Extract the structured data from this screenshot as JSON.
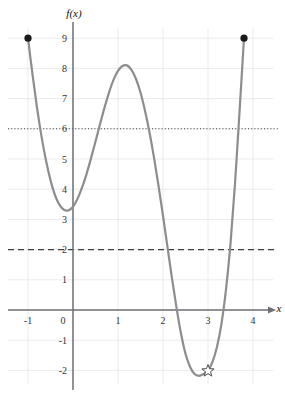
{
  "chart_data": {
    "type": "line",
    "title": "",
    "xlabel": "x",
    "ylabel": "f(x)",
    "xlim": [
      -1.45,
      4.45
    ],
    "ylim": [
      -2.45,
      9.35
    ],
    "grid": true,
    "legend": "none",
    "x_ticks": [
      -1,
      0,
      1,
      2,
      3,
      4
    ],
    "x_tick_labels": [
      "-1",
      "0",
      "1",
      "2",
      "3",
      "4"
    ],
    "y_ticks": [
      -2,
      -1,
      0,
      1,
      2,
      3,
      4,
      5,
      6,
      7,
      8,
      9
    ],
    "y_tick_labels": [
      "-2",
      "-1",
      "0",
      "1",
      "2",
      "3",
      "4",
      "5",
      "6",
      "7",
      "8",
      "9"
    ],
    "series": [
      {
        "name": "f(x)",
        "style": "solid",
        "color": "#8d8d91",
        "domain": [
          -1.0,
          3.8
        ],
        "points": [
          {
            "x": -1.0,
            "y": 9.0
          },
          {
            "x": -0.9,
            "y": 7.8
          },
          {
            "x": -0.8,
            "y": 6.7
          },
          {
            "x": -0.7,
            "y": 5.75
          },
          {
            "x": -0.6,
            "y": 4.95
          },
          {
            "x": -0.5,
            "y": 4.3
          },
          {
            "x": -0.4,
            "y": 3.8
          },
          {
            "x": -0.3,
            "y": 3.48
          },
          {
            "x": -0.2,
            "y": 3.32
          },
          {
            "x": -0.1,
            "y": 3.3
          },
          {
            "x": 0.0,
            "y": 3.42
          },
          {
            "x": 0.1,
            "y": 3.68
          },
          {
            "x": 0.2,
            "y": 4.05
          },
          {
            "x": 0.3,
            "y": 4.5
          },
          {
            "x": 0.4,
            "y": 5.02
          },
          {
            "x": 0.5,
            "y": 5.58
          },
          {
            "x": 0.6,
            "y": 6.15
          },
          {
            "x": 0.7,
            "y": 6.7
          },
          {
            "x": 0.8,
            "y": 7.2
          },
          {
            "x": 0.9,
            "y": 7.62
          },
          {
            "x": 1.0,
            "y": 7.92
          },
          {
            "x": 1.1,
            "y": 8.08
          },
          {
            "x": 1.2,
            "y": 8.1
          },
          {
            "x": 1.3,
            "y": 7.95
          },
          {
            "x": 1.4,
            "y": 7.65
          },
          {
            "x": 1.5,
            "y": 7.2
          },
          {
            "x": 1.6,
            "y": 6.6
          },
          {
            "x": 1.7,
            "y": 5.88
          },
          {
            "x": 1.8,
            "y": 5.05
          },
          {
            "x": 1.9,
            "y": 4.12
          },
          {
            "x": 2.0,
            "y": 3.12
          },
          {
            "x": 2.1,
            "y": 2.08
          },
          {
            "x": 2.2,
            "y": 1.05
          },
          {
            "x": 2.3,
            "y": 0.08
          },
          {
            "x": 2.4,
            "y": -0.78
          },
          {
            "x": 2.5,
            "y": -1.45
          },
          {
            "x": 2.6,
            "y": -1.88
          },
          {
            "x": 2.7,
            "y": -2.12
          },
          {
            "x": 2.8,
            "y": -2.18
          },
          {
            "x": 2.9,
            "y": -2.12
          },
          {
            "x": 3.0,
            "y": -2.0
          },
          {
            "x": 3.1,
            "y": -1.72
          },
          {
            "x": 3.2,
            "y": -1.22
          },
          {
            "x": 3.3,
            "y": -0.45
          },
          {
            "x": 3.4,
            "y": 0.68
          },
          {
            "x": 3.5,
            "y": 2.2
          },
          {
            "x": 3.6,
            "y": 4.18
          },
          {
            "x": 3.7,
            "y": 6.55
          },
          {
            "x": 3.8,
            "y": 9.0
          }
        ]
      }
    ],
    "reference_lines": [
      {
        "name": "dotted-line-y6",
        "axis": "horizontal",
        "value": 6,
        "style": "dotted",
        "label": "6"
      },
      {
        "name": "dashed-line-y2",
        "axis": "horizontal",
        "value": 2,
        "style": "dashed",
        "label": "2"
      }
    ],
    "markers": [
      {
        "name": "left-endpoint",
        "shape": "filled-circle",
        "x": -1.0,
        "y": 9.0
      },
      {
        "name": "right-endpoint",
        "shape": "filled-circle",
        "x": 3.8,
        "y": 9.0
      },
      {
        "name": "global-minimum-star",
        "shape": "open-star",
        "x": 3.0,
        "y": -2.0
      }
    ],
    "annotations": {
      "local_minimum_left": {
        "x": -0.1,
        "y": 3.3
      },
      "local_maximum": {
        "x": 1.15,
        "y": 8.1
      },
      "global_minimum": {
        "x": 2.85,
        "y": -2.18
      }
    }
  }
}
